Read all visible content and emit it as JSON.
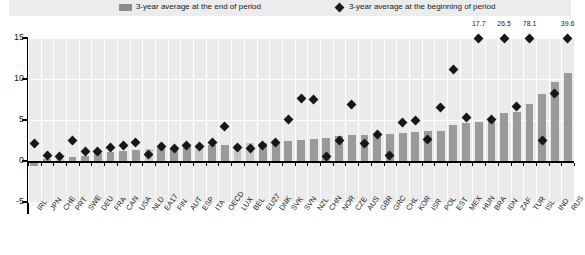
{
  "legend": {
    "bar_label": "3-year average at the end of period",
    "diamond_label": "3-year average at the beginning of period",
    "bar_swatch_icon": "bar-swatch",
    "diamond_swatch_icon": "diamond-swatch"
  },
  "axis": {
    "y_ticks": [
      "15",
      "10",
      "5",
      "0",
      "-5"
    ]
  },
  "colors": {
    "bar_dark": "#9a9a9a",
    "bar_light": "#c6c6c6",
    "marker": "#171717",
    "plot_bg": "#ebebeb",
    "legend_bg": "#ececec",
    "grid": "#ffffff",
    "axis": "#000000"
  },
  "chart_data": {
    "type": "bar",
    "title": "",
    "xlabel": "",
    "ylabel": "",
    "ylim": [
      -5,
      15
    ],
    "grid": true,
    "legend_position": "top",
    "categories": [
      "IRL",
      "JPN",
      "CHE",
      "PRT",
      "SWE",
      "DEU",
      "FRA",
      "CAN",
      "USA",
      "NLD",
      "EA17",
      "FIN",
      "AUT",
      "ESP",
      "ITA",
      "OECD",
      "LUX",
      "BEL",
      "EU27",
      "DNK",
      "SVK",
      "SVN",
      "NZL",
      "CHN",
      "NOR",
      "CZE",
      "AUS",
      "GBR",
      "GRC",
      "CHL",
      "KOR",
      "ISR",
      "POL",
      "EST",
      "MEX",
      "HUN",
      "BRA",
      "IDN",
      "ZAF",
      "TUR",
      "ISL",
      "IND",
      "RUS"
    ],
    "series": [
      {
        "name": "3-year average at the end of period",
        "type": "bar",
        "values": [
          -0.6,
          0.2,
          0.3,
          0.5,
          0.6,
          1.0,
          1.1,
          1.2,
          1.4,
          1.5,
          1.6,
          1.6,
          1.7,
          1.8,
          1.9,
          2.0,
          2.0,
          2.2,
          2.2,
          2.3,
          2.5,
          2.6,
          2.7,
          2.8,
          3.0,
          3.2,
          3.2,
          3.2,
          3.3,
          3.4,
          3.5,
          3.6,
          3.7,
          4.4,
          4.6,
          4.8,
          5.3,
          5.9,
          6.0,
          6.9,
          8.2,
          9.6,
          10.7
        ]
      },
      {
        "name": "3-year average at the beginning of period",
        "type": "scatter",
        "values": [
          2.1,
          0.7,
          0.5,
          2.5,
          1.2,
          1.1,
          1.6,
          1.9,
          2.2,
          0.8,
          1.8,
          1.5,
          1.9,
          1.8,
          2.2,
          4.2,
          1.6,
          1.5,
          1.9,
          2.2,
          5.1,
          7.6,
          7.5,
          0.5,
          2.5,
          6.9,
          2.1,
          3.2,
          0.7,
          4.7,
          4.9,
          2.6,
          6.5,
          11.2,
          5.3,
          17.7,
          5.1,
          26.5,
          6.7,
          78.1,
          2.5,
          8.2,
          39.6
        ]
      }
    ],
    "offscale_labels": [
      {
        "category": "HUN",
        "value": "17.7"
      },
      {
        "category": "IDN",
        "value": "26.5"
      },
      {
        "category": "TUR",
        "value": "78.1"
      },
      {
        "category": "RUS",
        "value": "39.6"
      }
    ]
  }
}
